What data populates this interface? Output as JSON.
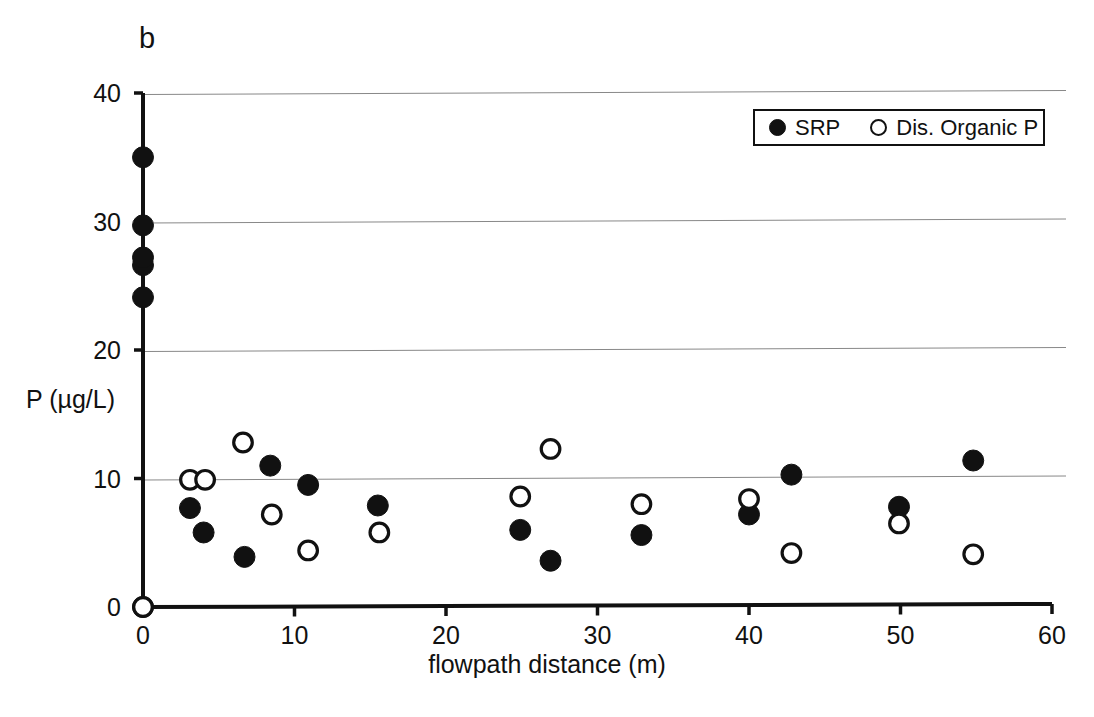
{
  "panel": {
    "label": "b"
  },
  "legend": {
    "entries": [
      {
        "marker": "filled-circle-icon",
        "label": "SRP"
      },
      {
        "marker": "open-circle-icon",
        "label": "Dis. Organic P"
      }
    ]
  },
  "axes": {
    "x_ticks": [
      "0",
      "10",
      "20",
      "30",
      "40",
      "50",
      "60"
    ],
    "y_ticks": [
      "0",
      "10",
      "20",
      "30",
      "40"
    ],
    "xlabel": "flowpath distance (m)",
    "ylabel": "P (µg/L)"
  },
  "colors": {
    "marker": "#111111",
    "axis": "#111111",
    "grid": "#888888",
    "background": "#ffffff"
  },
  "chart_data": {
    "type": "scatter",
    "title": "b",
    "xlabel": "flowpath distance (m)",
    "ylabel": "P (µg/L)",
    "xlim": [
      0,
      60
    ],
    "ylim": [
      0,
      40
    ],
    "xticks": [
      0,
      10,
      20,
      30,
      40,
      50,
      60
    ],
    "yticks": [
      0,
      10,
      20,
      30,
      40
    ],
    "grid": "horizontal gridlines at y = 10, 20, 30, 40",
    "legend_position": "top-right",
    "series": [
      {
        "name": "SRP",
        "marker": "filled-circle",
        "points": [
          [
            0.0,
            0.0
          ],
          [
            0.0,
            24.1
          ],
          [
            0.0,
            26.6
          ],
          [
            0.0,
            27.2
          ],
          [
            0.0,
            29.7
          ],
          [
            0.0,
            35.0
          ],
          [
            3.1,
            7.7
          ],
          [
            4.0,
            5.8
          ],
          [
            6.7,
            3.9
          ],
          [
            8.4,
            11.0
          ],
          [
            10.9,
            9.5
          ],
          [
            15.5,
            7.9
          ],
          [
            24.9,
            6.0
          ],
          [
            26.9,
            3.6
          ],
          [
            32.9,
            5.6
          ],
          [
            40.0,
            7.2
          ],
          [
            42.8,
            10.3
          ],
          [
            49.9,
            7.8
          ],
          [
            54.8,
            11.4
          ]
        ]
      },
      {
        "name": "Dis. Organic P",
        "marker": "open-circle",
        "points": [
          [
            0.0,
            0.0
          ],
          [
            3.1,
            9.9
          ],
          [
            4.1,
            9.9
          ],
          [
            6.6,
            12.8
          ],
          [
            8.5,
            7.2
          ],
          [
            10.9,
            4.4
          ],
          [
            15.6,
            5.8
          ],
          [
            24.9,
            8.6
          ],
          [
            26.9,
            12.3
          ],
          [
            32.9,
            8.0
          ],
          [
            40.0,
            8.4
          ],
          [
            42.8,
            4.2
          ],
          [
            49.9,
            6.5
          ],
          [
            54.8,
            4.1
          ]
        ]
      }
    ]
  }
}
